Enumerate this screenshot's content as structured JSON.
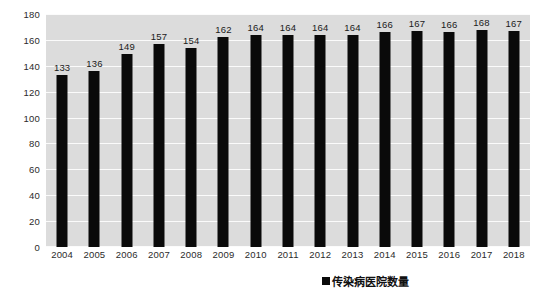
{
  "chart_data": {
    "type": "bar",
    "title": "",
    "subtitle": "",
    "xlabel": "",
    "ylabel": "",
    "categories": [
      "2004",
      "2005",
      "2006",
      "2007",
      "2008",
      "2009",
      "2010",
      "2011",
      "2012",
      "2013",
      "2014",
      "2015",
      "2016",
      "2017",
      "2018"
    ],
    "values": [
      133,
      136,
      149,
      157,
      154,
      162,
      164,
      164,
      164,
      164,
      166,
      167,
      166,
      168,
      167
    ],
    "series": [
      {
        "name": "传染病医院数量",
        "values": [
          133,
          136,
          149,
          157,
          154,
          162,
          164,
          164,
          164,
          164,
          166,
          167,
          166,
          168,
          167
        ],
        "color": "#0a0a0a"
      }
    ],
    "ylim": [
      0,
      180
    ],
    "y_ticks": [
      0,
      20,
      40,
      60,
      80,
      100,
      120,
      140,
      160,
      180
    ],
    "y_tick_labels": [
      "0",
      "20",
      "40",
      "60",
      "80",
      "100",
      "120",
      "140",
      "160",
      "180"
    ],
    "grid": true,
    "grid_color": "#fbfbfb",
    "plot_background": "#dcdcdc",
    "page_background": "#ffffff",
    "data_labels": [
      "133",
      "136",
      "149",
      "157",
      "154",
      "162",
      "164",
      "164",
      "164",
      "164",
      "166",
      "167",
      "166",
      "168",
      "167"
    ],
    "legend": {
      "position": "bottom-right",
      "entries": [
        {
          "label": "传染病医院数量",
          "marker": "square",
          "color": "#0a0a0a"
        }
      ]
    }
  }
}
